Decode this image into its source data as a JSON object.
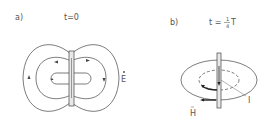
{
  "panel_a": {
    "label": "a)",
    "time": "t=0",
    "field_label": "E"
  },
  "panel_b": {
    "label": "b)",
    "time_prefix": "t =",
    "time_num": "1",
    "time_den": "4",
    "time_suffix": "T",
    "current_label": "I",
    "field_label": "H"
  },
  "colors": {
    "line": "#444444",
    "rod_fill": "#e8e8e8"
  }
}
